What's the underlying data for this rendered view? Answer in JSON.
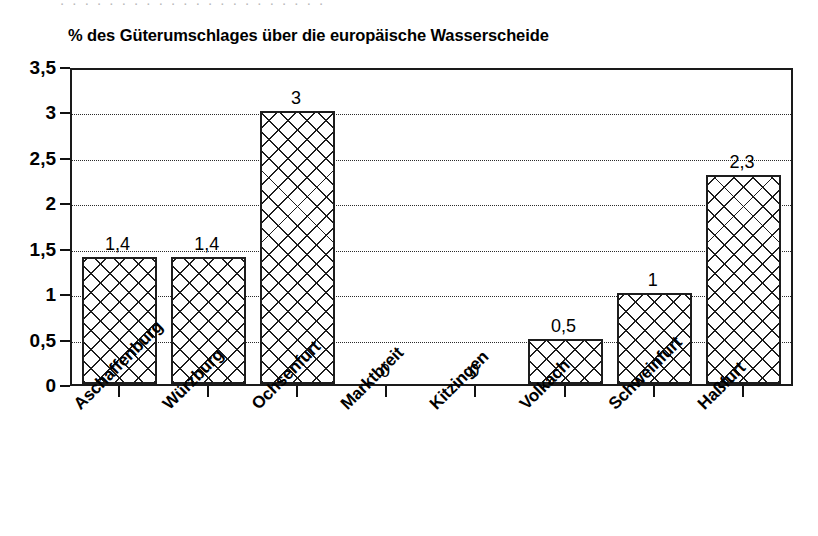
{
  "bleed_text": ". . .  . . . . . . . .   . . .  . .  . .   . . .  .",
  "chart_data": {
    "type": "bar",
    "title": "% des Güterumschlages über die europäische Wasserscheide",
    "xlabel": "",
    "ylabel": "",
    "ylim": [
      0,
      3.5
    ],
    "grid": true,
    "legend": "none",
    "categories": [
      "Aschaffenburg",
      "Würzburg",
      "Ochsenfurt",
      "Marktbreit",
      "Kitzingen",
      "Volkach",
      "Schweinfurt",
      "Haßfurt"
    ],
    "values": [
      1.4,
      1.4,
      3,
      0,
      0,
      0.5,
      1,
      2.3
    ],
    "value_labels": [
      "1,4",
      "1,4",
      "3",
      "0",
      "0",
      "0,5",
      "1",
      "2,3"
    ],
    "ytick_values": [
      0,
      0.5,
      1,
      1.5,
      2,
      2.5,
      3,
      3.5
    ],
    "ytick_labels": [
      "0",
      "0,5",
      "1",
      "1,5",
      "2",
      "2,5",
      "3",
      "3,5"
    ],
    "bar_fill": "crosshatch",
    "bar_color": "#1d1d1d",
    "background": "#ffffff"
  }
}
